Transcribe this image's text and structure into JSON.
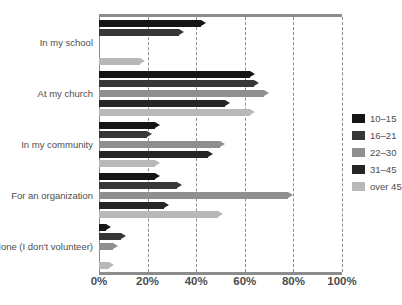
{
  "chart_data": {
    "type": "bar",
    "orientation": "horizontal",
    "title": "",
    "xlabel": "",
    "ylabel": "",
    "xlim": [
      0,
      100
    ],
    "xticks": [
      "0%",
      "20%",
      "40%",
      "60%",
      "80%",
      "100%"
    ],
    "xtick_values": [
      0,
      20,
      40,
      60,
      80,
      100
    ],
    "grid": "vertical-dashed",
    "legend_position": "right",
    "categories": [
      "In my school",
      "At my church",
      "In my community",
      "For an organization",
      "None (I don't volunteer)"
    ],
    "series": [
      {
        "name": "10–15",
        "color": "#151515",
        "values": [
          44,
          64,
          25,
          25,
          5
        ]
      },
      {
        "name": "16–21",
        "color": "#373737",
        "values": [
          35,
          66,
          22,
          34,
          11
        ]
      },
      {
        "name": "22–30",
        "color": "#8f8f8f",
        "values": [
          0,
          70,
          52,
          80,
          8
        ]
      },
      {
        "name": "31–45",
        "color": "#252525",
        "values": [
          0,
          54,
          47,
          29,
          0
        ]
      },
      {
        "name": "over 45",
        "color": "#b8b8b8",
        "values": [
          19,
          64,
          25,
          51,
          6
        ]
      }
    ]
  },
  "legend": {
    "items": [
      {
        "label": "10–15",
        "color": "#151515"
      },
      {
        "label": "16–21",
        "color": "#373737"
      },
      {
        "label": "22–30",
        "color": "#8f8f8f"
      },
      {
        "label": "31–45",
        "color": "#252525"
      },
      {
        "label": "over 45",
        "color": "#b8b8b8"
      }
    ]
  },
  "axis": {
    "ticks": [
      {
        "label": "0%",
        "value": 0
      },
      {
        "label": "20%",
        "value": 20
      },
      {
        "label": "40%",
        "value": 40
      },
      {
        "label": "60%",
        "value": 60
      },
      {
        "label": "80%",
        "value": 80
      },
      {
        "label": "100%",
        "value": 100
      }
    ]
  },
  "colors": {
    "frame": "#8c8c8c",
    "grid": "#8c8c8c",
    "text": "#4d4d4d",
    "background": "#ffffff"
  }
}
